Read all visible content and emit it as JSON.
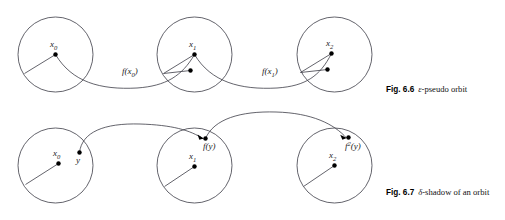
{
  "figures": [
    {
      "id": "fig-6-6",
      "caption_number": "Fig. 6.6",
      "caption_symbol": "ε",
      "caption_text": "-pseudo orbit",
      "caption_full": "Fig. 6.6 ε-pseudo orbit",
      "circles": [
        {
          "name": "circle-x0",
          "cx": 55.5,
          "cy": 54.5,
          "r": 37.5
        },
        {
          "name": "circle-x1",
          "cx": 194.5,
          "cy": 54.5,
          "r": 37.5
        },
        {
          "name": "circle-x2",
          "cx": 334.5,
          "cy": 54.5,
          "r": 37.5
        }
      ],
      "points": [
        {
          "name": "point-x0",
          "label": "x",
          "sub": "0",
          "cx": 55.5,
          "cy": 54.5,
          "r": 2.2,
          "label_x": 50,
          "label_y": 47
        },
        {
          "name": "point-fx0-image",
          "label": "",
          "sub": "",
          "cx": 190.5,
          "cy": 70.5,
          "r": 2.2,
          "label_x": 0,
          "label_y": 0
        },
        {
          "name": "point-x1",
          "label": "x",
          "sub": "1",
          "cx": 194.5,
          "cy": 54.5,
          "r": 2.2,
          "label_x": 189,
          "label_y": 47
        },
        {
          "name": "point-fx1-image",
          "label": "",
          "sub": "",
          "cx": 327.5,
          "cy": 69.5,
          "r": 2.2,
          "label_x": 0,
          "label_y": 0
        },
        {
          "name": "point-x2",
          "label": "x",
          "sub": "2",
          "cx": 331.5,
          "cy": 53.5,
          "r": 2.2,
          "label_x": 326,
          "label_y": 46
        }
      ],
      "radii": [
        {
          "name": "radius-x0-left",
          "d": "M 55.5 54.5 L 24.5 73.5"
        },
        {
          "name": "radius-x1-left",
          "d": "M 194.5 54.5 L 163.5 73.5"
        },
        {
          "name": "radius-x1-to-image",
          "d": "M 190.5 70.5 L 163.5 73.5"
        },
        {
          "name": "radius-x2-left",
          "d": "M 331.5 53.5 L 300.5 72.5"
        },
        {
          "name": "radius-x2-to-image",
          "d": "M 327.5 69.5 L 300.5 72.5"
        }
      ],
      "curves": [
        {
          "name": "curve-f-x0",
          "d": "M 55.5 54.5 C 72 82 100 90 137 88 C 166 86 182 76 194.5 54.5"
        },
        {
          "name": "curve-f-x1",
          "d": "M 194.5 54.5 C 211 82 240 90 277 88 C 306 86 320 76 331.5 53.5"
        }
      ],
      "curve_labels": [
        {
          "name": "label-f-x0",
          "label": "f(x",
          "sub": "0",
          "tail": ")",
          "x": 122,
          "y": 74
        },
        {
          "name": "label-f-x1",
          "label": "f(x",
          "sub": "1",
          "tail": ")",
          "x": 262,
          "y": 74
        }
      ],
      "arrows": []
    },
    {
      "id": "fig-6-7",
      "caption_number": "Fig. 6.7",
      "caption_symbol": "δ",
      "caption_text": "-shadow of an orbit",
      "caption_full": "Fig. 6.7 δ-shadow of an orbit",
      "circles": [
        {
          "name": "circle-x0",
          "cx": 55.5,
          "cy": 165.5,
          "r": 37.5
        },
        {
          "name": "circle-x1",
          "cx": 194.5,
          "cy": 165.5,
          "r": 37.5
        },
        {
          "name": "circle-x2",
          "cx": 334.5,
          "cy": 165.5,
          "r": 37.5
        }
      ],
      "points": [
        {
          "name": "point-x0",
          "label": "x",
          "sub": "0",
          "cx": 58.5,
          "cy": 163.5,
          "r": 2.2,
          "label_x": 53,
          "label_y": 156
        },
        {
          "name": "point-y",
          "label": "y",
          "sub": "",
          "cx": 79.5,
          "cy": 152.5,
          "r": 2.2,
          "label_x": 76,
          "label_y": 163
        },
        {
          "name": "point-x1",
          "label": "x",
          "sub": "1",
          "cx": 194.5,
          "cy": 166.5,
          "r": 2.2,
          "label_x": 189,
          "label_y": 159
        },
        {
          "name": "point-fy",
          "label": "f(y)",
          "sub": "",
          "cx": 205.5,
          "cy": 138.5,
          "r": 2.2,
          "label_x": 203,
          "label_y": 149
        },
        {
          "name": "point-x2",
          "label": "x",
          "sub": "2",
          "cx": 334.5,
          "cy": 165.5,
          "r": 2.2,
          "label_x": 329,
          "label_y": 158
        },
        {
          "name": "point-f2y",
          "label": "f",
          "sub": "2",
          "tail": "(y)",
          "cx": 348.5,
          "cy": 137.5,
          "r": 2.2,
          "label_x": 345,
          "label_y": 149
        }
      ],
      "radii": [
        {
          "name": "radius-x0-left",
          "d": "M 58.5 163.5 L 25.5 184.5"
        },
        {
          "name": "radius-x1-left",
          "d": "M 194.5 166.5 L 164.5 186.5"
        },
        {
          "name": "radius-x2-left",
          "d": "M 334.5 165.5 L 303.5 186.5"
        }
      ],
      "curves": [
        {
          "name": "curve-y-to-fy",
          "d": "M 79.5 152.5 C 82 132 104 123 140 124 C 172 125 190 130 203.5 139"
        },
        {
          "name": "curve-fy-to-f2y",
          "d": "M 205.5 138.5 C 214 119 240 111 276 112 C 312 113 334 124 346.5 138"
        }
      ],
      "curve_labels": [],
      "arrows": [
        {
          "name": "arrowhead-to-fy",
          "d": "M 203.8 138.4 L 197.6 134.6 L 199.3 139.8 Z"
        },
        {
          "name": "arrowhead-to-f2y",
          "d": "M 346.8 137.9 L 340.2 134.8 L 342.4 139.8 Z"
        }
      ]
    }
  ],
  "page": {
    "background": "#ffffff",
    "stroke_color": "#3c3c46",
    "dot_color": "#000000",
    "text_color": "#111111"
  }
}
